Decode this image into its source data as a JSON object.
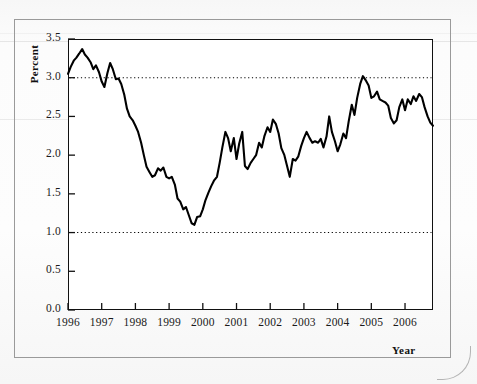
{
  "chart_data": {
    "type": "line",
    "title": "",
    "xlabel": "Year",
    "ylabel": "Percent",
    "ylim": [
      0.0,
      3.5
    ],
    "xlim": [
      1996.0,
      2006.83
    ],
    "grid": false,
    "reference_lines": [
      {
        "value": 3.0,
        "style": "dotted"
      },
      {
        "value": 1.0,
        "style": "dotted"
      }
    ],
    "yticks": [
      "0.0",
      "0.5",
      "1.0",
      "1.5",
      "2.0",
      "2.5",
      "3.0",
      "3.5"
    ],
    "ytick_values": [
      0.0,
      0.5,
      1.0,
      1.5,
      2.0,
      2.5,
      3.0,
      3.5
    ],
    "xticks": [
      "1996",
      "1997",
      "1998",
      "1999",
      "2000",
      "2001",
      "2002",
      "2003",
      "2004",
      "2005",
      "2006"
    ],
    "xtick_values": [
      1996,
      1997,
      1998,
      1999,
      2000,
      2001,
      2002,
      2003,
      2004,
      2005,
      2006
    ],
    "line_color": "#000000",
    "line_width": 2.1,
    "series": [
      {
        "name": "Percent",
        "x": [
          1996.0,
          1996.08,
          1996.17,
          1996.25,
          1996.33,
          1996.42,
          1996.5,
          1996.58,
          1996.67,
          1996.75,
          1996.83,
          1996.92,
          1997.0,
          1997.08,
          1997.17,
          1997.25,
          1997.33,
          1997.42,
          1997.5,
          1997.58,
          1997.67,
          1997.75,
          1997.83,
          1997.92,
          1998.0,
          1998.08,
          1998.17,
          1998.25,
          1998.33,
          1998.42,
          1998.5,
          1998.58,
          1998.67,
          1998.75,
          1998.83,
          1998.92,
          1999.0,
          1999.08,
          1999.17,
          1999.25,
          1999.33,
          1999.42,
          1999.5,
          1999.58,
          1999.67,
          1999.75,
          1999.83,
          1999.92,
          2000.0,
          2000.08,
          2000.17,
          2000.25,
          2000.33,
          2000.42,
          2000.5,
          2000.58,
          2000.67,
          2000.75,
          2000.83,
          2000.92,
          2001.0,
          2001.08,
          2001.17,
          2001.25,
          2001.33,
          2001.42,
          2001.5,
          2001.58,
          2001.67,
          2001.75,
          2001.83,
          2001.92,
          2002.0,
          2002.08,
          2002.17,
          2002.25,
          2002.33,
          2002.42,
          2002.5,
          2002.58,
          2002.67,
          2002.75,
          2002.83,
          2002.92,
          2003.0,
          2003.08,
          2003.17,
          2003.25,
          2003.33,
          2003.42,
          2003.5,
          2003.58,
          2003.67,
          2003.75,
          2003.83,
          2003.92,
          2004.0,
          2004.08,
          2004.17,
          2004.25,
          2004.33,
          2004.42,
          2004.5,
          2004.58,
          2004.67,
          2004.75,
          2004.83,
          2004.92,
          2005.0,
          2005.08,
          2005.17,
          2005.25,
          2005.33,
          2005.42,
          2005.5,
          2005.58,
          2005.67,
          2005.75,
          2005.83,
          2005.92,
          2006.0,
          2006.08,
          2006.17,
          2006.25,
          2006.33,
          2006.42,
          2006.5,
          2006.58,
          2006.67,
          2006.75,
          2006.83
        ],
        "values": [
          3.05,
          3.14,
          3.22,
          3.26,
          3.31,
          3.37,
          3.3,
          3.26,
          3.2,
          3.11,
          3.16,
          3.07,
          2.95,
          2.88,
          3.06,
          3.19,
          3.11,
          2.98,
          2.99,
          2.92,
          2.78,
          2.6,
          2.5,
          2.45,
          2.38,
          2.3,
          2.16,
          2.0,
          1.85,
          1.78,
          1.72,
          1.74,
          1.83,
          1.8,
          1.84,
          1.72,
          1.7,
          1.72,
          1.62,
          1.44,
          1.4,
          1.3,
          1.33,
          1.23,
          1.12,
          1.1,
          1.2,
          1.21,
          1.3,
          1.42,
          1.52,
          1.6,
          1.67,
          1.72,
          1.9,
          2.1,
          2.3,
          2.22,
          2.05,
          2.22,
          1.95,
          2.15,
          2.3,
          1.86,
          1.82,
          1.9,
          1.95,
          2.0,
          2.16,
          2.1,
          2.25,
          2.36,
          2.3,
          2.46,
          2.4,
          2.28,
          2.09,
          2.0,
          1.86,
          1.72,
          1.95,
          1.93,
          1.98,
          2.12,
          2.22,
          2.3,
          2.22,
          2.16,
          2.18,
          2.16,
          2.21,
          2.1,
          2.24,
          2.5,
          2.3,
          2.18,
          2.05,
          2.14,
          2.28,
          2.22,
          2.44,
          2.65,
          2.52,
          2.74,
          2.92,
          3.02,
          2.97,
          2.9,
          2.74,
          2.76,
          2.82,
          2.72,
          2.7,
          2.68,
          2.64,
          2.48,
          2.41,
          2.45,
          2.62,
          2.72,
          2.58,
          2.72,
          2.66,
          2.76,
          2.7,
          2.79,
          2.75,
          2.62,
          2.5,
          2.42,
          2.38
        ]
      }
    ]
  }
}
